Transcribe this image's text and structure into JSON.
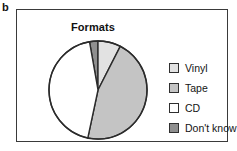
{
  "panel": {
    "label": "b"
  },
  "chart_title": "Formats",
  "legend": {
    "items": [
      {
        "label": "Vinyl",
        "color": "#e2e2e2",
        "swatch_name": "legend-swatch-vinyl"
      },
      {
        "label": "Tape",
        "color": "#c4c4c4",
        "swatch_name": "legend-swatch-tape"
      },
      {
        "label": "CD",
        "color": "#ffffff",
        "swatch_name": "legend-swatch-cd"
      },
      {
        "label": "Don't know",
        "color": "#8f8f8f",
        "swatch_name": "legend-swatch-dont-know"
      }
    ]
  },
  "chart_data": {
    "type": "pie",
    "title": "Formats",
    "xlabel": "",
    "ylabel": "",
    "labels": [
      "Vinyl",
      "Tape",
      "CD",
      "Don't know"
    ],
    "values": [
      7.5,
      46,
      44,
      2.5
    ],
    "unit": "percent",
    "colors": [
      "#e2e2e2",
      "#c4c4c4",
      "#ffffff",
      "#8f8f8f"
    ],
    "start_angle_deg": -10,
    "direction": "clockwise",
    "legend_position": "right",
    "grid": false,
    "slices": [
      {
        "label": "Don't know",
        "value": 2.5,
        "color": "#8f8f8f",
        "start_deg": -10,
        "end_deg": 0
      },
      {
        "label": "Vinyl",
        "value": 7.5,
        "color": "#e2e2e2",
        "start_deg": 0,
        "end_deg": 27
      },
      {
        "label": "Tape",
        "value": 46,
        "color": "#c4c4c4",
        "start_deg": 27,
        "end_deg": 192
      },
      {
        "label": "CD",
        "value": 44,
        "color": "#ffffff",
        "start_deg": 192,
        "end_deg": 350
      }
    ],
    "geometry": {
      "cx": 50,
      "cy": 50,
      "r": 49,
      "stroke": "#2b2b2b",
      "stroke_width": 1.4
    }
  }
}
